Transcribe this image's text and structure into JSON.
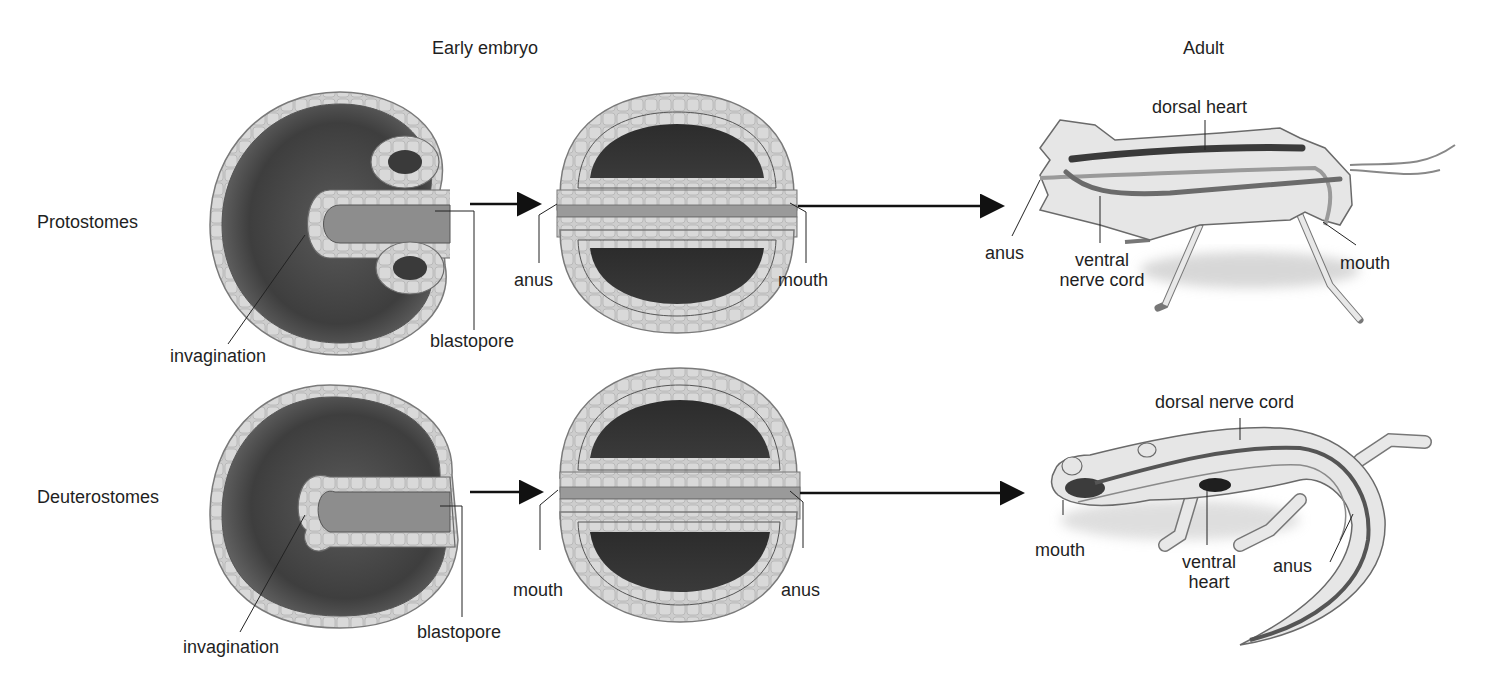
{
  "headers": {
    "early_embryo": "Early embryo",
    "adult": "Adult"
  },
  "rows": [
    {
      "name": "Protostomes",
      "embryo1_labels": {
        "invagination": "invagination",
        "blastopore": "blastopore"
      },
      "embryo2_labels": {
        "left": "anus",
        "right": "mouth"
      },
      "adult": {
        "organism": "grasshopper",
        "labels": {
          "top": "dorsal heart",
          "left": "anus",
          "bottom_line1": "ventral",
          "bottom_line2": "nerve cord",
          "right": "mouth"
        }
      }
    },
    {
      "name": "Deuterostomes",
      "embryo1_labels": {
        "invagination": "invagination",
        "blastopore": "blastopore"
      },
      "embryo2_labels": {
        "left": "mouth",
        "right": "anus"
      },
      "adult": {
        "organism": "salamander",
        "labels": {
          "top": "dorsal nerve cord",
          "left": "mouth",
          "middle_line1": "ventral",
          "middle_line2": "heart",
          "right": "anus"
        }
      }
    }
  ],
  "colors": {
    "cell_layer": "#cfcfcf",
    "cavity_dark": "#3a3a3a",
    "cavity_mid": "#6e6e6e",
    "body_fill": "#e6e6e6",
    "outline": "#707070",
    "arrow": "#111111"
  }
}
